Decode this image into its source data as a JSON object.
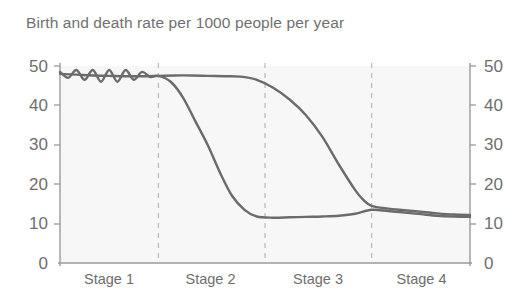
{
  "chart_data": {
    "type": "line",
    "title": "Birth and death rate per 1000 people per year",
    "xlabel": "",
    "ylabel": "",
    "ylim": [
      0,
      50
    ],
    "yticks": [
      0,
      10,
      20,
      30,
      40,
      50
    ],
    "ytick_labels": [
      "0",
      "10",
      "20",
      "30",
      "40",
      "50"
    ],
    "right_axis_ticks": [
      0,
      10,
      20,
      30,
      40,
      50
    ],
    "right_axis_tick_labels": [
      "0",
      "10",
      "20",
      "30",
      "40",
      "50"
    ],
    "grid": false,
    "legend_position": "inline-annotation",
    "categories": [
      "Stage 1",
      "Stage 2",
      "Stage 3",
      "Stage 4"
    ],
    "stage_boundaries": [
      24,
      50,
      76
    ],
    "series": [
      {
        "name": "Birth rate",
        "color": "#6b6b6b",
        "x": [
          0,
          4,
          8,
          12,
          16,
          20,
          24,
          28,
          32,
          36,
          40,
          44,
          48,
          52,
          56,
          60,
          64,
          68,
          72,
          74,
          76,
          80,
          84,
          88,
          92,
          96,
          100
        ],
        "values": [
          48,
          47.8,
          47.6,
          47.5,
          47.4,
          47.4,
          47.5,
          47.6,
          47.6,
          47.5,
          47.4,
          47.3,
          46.5,
          44.5,
          41.5,
          37.5,
          32,
          25,
          18.5,
          16,
          14.5,
          13.8,
          13.4,
          13,
          12.6,
          12.3,
          12.2
        ]
      },
      {
        "name": "Death rate",
        "color": "#6b6b6b",
        "x": [
          0,
          2,
          4,
          6,
          8,
          10,
          12,
          14,
          16,
          18,
          20,
          22,
          24,
          27,
          30,
          33,
          36,
          39,
          42,
          45,
          48,
          52,
          56,
          60,
          64,
          68,
          72,
          76,
          80,
          84,
          88,
          92,
          96,
          100
        ],
        "values": [
          48.5,
          47,
          49,
          46.5,
          49,
          46,
          49,
          46,
          49,
          46.5,
          48.5,
          47.2,
          47.5,
          46,
          42,
          36,
          30,
          23,
          17,
          13.5,
          11.8,
          11.5,
          11.6,
          11.7,
          11.8,
          12,
          12.5,
          13.5,
          13.2,
          12.8,
          12.4,
          12,
          11.8,
          11.7
        ]
      }
    ],
    "annotations": [
      {
        "text": "Birth rate",
        "x": 64,
        "y": 43
      },
      {
        "text": "Death rate",
        "x": 33,
        "y": 7
      }
    ],
    "colors": {
      "line": "#6b6b6b",
      "axis": "#9a9a9a",
      "divider": "#bdbdbd",
      "plot_background": "#f7f7f7",
      "text": "#6e6e6e"
    }
  }
}
